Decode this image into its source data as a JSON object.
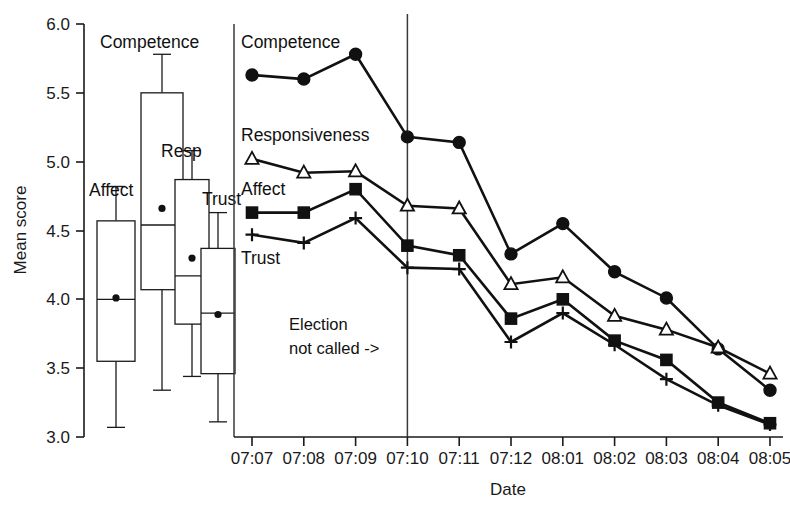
{
  "chart_data": {
    "type": "line",
    "title": "",
    "xlabel": "Date",
    "ylabel": "Mean score",
    "ylim": [
      3.0,
      6.0
    ],
    "ytick_labels": [
      "6.0",
      "5.5",
      "5.0",
      "4.5",
      "4.0",
      "3.5",
      "3.0"
    ],
    "ytick_values": [
      6.0,
      5.5,
      5.0,
      4.5,
      4.0,
      3.5,
      3.0
    ],
    "grid": false,
    "legend_position": "inline-labels",
    "categories": [
      "07:07",
      "07:08",
      "07:09",
      "07:10",
      "07:11",
      "07:12",
      "08:01",
      "08:02",
      "08:03",
      "08:04",
      "08:05"
    ],
    "series": [
      {
        "name": "Competence",
        "marker": "filled-circle",
        "values": [
          5.63,
          5.6,
          5.78,
          5.18,
          5.14,
          4.33,
          4.55,
          4.2,
          4.01,
          3.64,
          3.34
        ]
      },
      {
        "name": "Responsiveness",
        "marker": "open-triangle",
        "values": [
          5.02,
          4.92,
          4.93,
          4.68,
          4.66,
          4.11,
          4.16,
          3.88,
          3.78,
          3.65,
          3.46
        ]
      },
      {
        "name": "Affect",
        "marker": "filled-square",
        "values": [
          4.63,
          4.63,
          4.8,
          4.39,
          4.32,
          3.86,
          4.0,
          3.7,
          3.56,
          3.25,
          3.1
        ]
      },
      {
        "name": "Trust",
        "marker": "plus",
        "values": [
          4.47,
          4.41,
          4.59,
          4.23,
          4.22,
          3.69,
          3.9,
          3.67,
          3.42,
          3.23,
          3.09
        ]
      }
    ],
    "annotation": {
      "line1": "Election",
      "line2": "not called ->",
      "marker_category": "07:10"
    },
    "boxplots": {
      "items": [
        {
          "label": "Affect",
          "whisker_low": 3.07,
          "q1": 3.55,
          "median": 4.0,
          "q3": 4.57,
          "whisker_high": 4.82,
          "mean": 4.01
        },
        {
          "label": "Competence",
          "whisker_low": 3.34,
          "q1": 4.07,
          "median": 4.54,
          "q3": 5.5,
          "whisker_high": 5.78,
          "mean": 4.66
        },
        {
          "label": "Resp",
          "whisker_low": 3.44,
          "q1": 3.82,
          "median": 4.17,
          "q3": 4.87,
          "whisker_high": 5.08,
          "mean": 4.3
        },
        {
          "label": "Trust",
          "whisker_low": 3.11,
          "q1": 3.46,
          "median": 3.9,
          "q3": 4.37,
          "whisker_high": 4.63,
          "mean": 3.89
        }
      ]
    }
  },
  "colors": {
    "ink": "#111111",
    "axis": "#1a1a1a",
    "background": "#ffffff"
  }
}
